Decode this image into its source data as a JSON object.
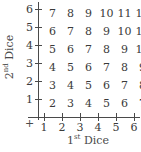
{
  "chart_data": {
    "type": "table",
    "title": "",
    "xlabel": "1st Dice",
    "ylabel": "2nd Dice",
    "xlabel_base": "1",
    "xlabel_sup": "st",
    "xlabel_rest": " Dice",
    "ylabel_base": "2",
    "ylabel_sup": "nd",
    "ylabel_rest": " Dice",
    "grid": false,
    "legend": "none",
    "origin_symbol": "+",
    "x": [
      1,
      2,
      3,
      4,
      5,
      6
    ],
    "y": [
      1,
      2,
      3,
      4,
      5,
      6
    ],
    "xlim": [
      1,
      6
    ],
    "ylim": [
      1,
      6
    ],
    "xtick_labels": [
      "1",
      "2",
      "3",
      "4",
      "5",
      "6"
    ],
    "ytick_labels": [
      "6",
      "5",
      "4",
      "3",
      "2",
      "1"
    ],
    "rows": [
      {
        "y": "6",
        "values": [
          "7",
          "8",
          "9",
          "10",
          "11",
          "12"
        ]
      },
      {
        "y": "5",
        "values": [
          "6",
          "7",
          "8",
          "9",
          "10",
          "11"
        ]
      },
      {
        "y": "4",
        "values": [
          "5",
          "6",
          "7",
          "8",
          "9",
          "10"
        ]
      },
      {
        "y": "3",
        "values": [
          "4",
          "5",
          "6",
          "7",
          "8",
          "9"
        ]
      },
      {
        "y": "2",
        "values": [
          "3",
          "4",
          "5",
          "6",
          "7",
          "8"
        ]
      },
      {
        "y": "1",
        "values": [
          "2",
          "3",
          "4",
          "5",
          "6",
          "7"
        ]
      }
    ],
    "colors": {
      "text": "#3a3a3a",
      "axis": "#4a4a4a",
      "background": "#ffffff"
    }
  }
}
